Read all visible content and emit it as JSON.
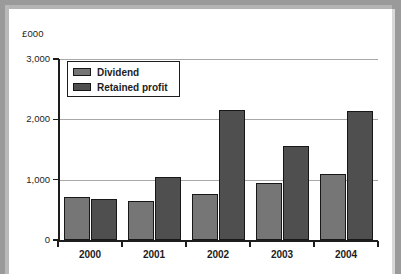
{
  "chart_data": {
    "type": "bar",
    "title": "",
    "subtitle": "",
    "xlabel": "",
    "ylabel": "£000",
    "categories": [
      "2000",
      "2001",
      "2002",
      "2003",
      "2004"
    ],
    "series": [
      {
        "name": "Dividend",
        "color": "#767676",
        "values": [
          720,
          640,
          770,
          950,
          1090
        ]
      },
      {
        "name": "Retained profit",
        "color": "#4f4f4f",
        "values": [
          680,
          1040,
          2160,
          1550,
          2140
        ]
      }
    ],
    "ylim": [
      0,
      3000
    ],
    "yticks": [
      0,
      1000,
      2000,
      3000
    ],
    "ytick_labels": [
      "0",
      "1,000",
      "2,000",
      "3,000"
    ],
    "grid": true,
    "legend_position": "top-left"
  },
  "legend": {
    "entries": [
      {
        "label": "Dividend"
      },
      {
        "label": "Retained profit"
      }
    ]
  },
  "colors": {
    "dividend": "#767676",
    "retained_profit": "#4f4f4f",
    "axis": "#1d1d1d",
    "gridline": "#a8a8a8",
    "page": "#ffffff",
    "backdrop": "#9a9a9a"
  }
}
